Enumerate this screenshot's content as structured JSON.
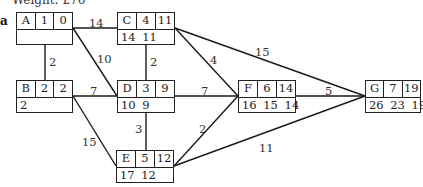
{
  "header": {
    "title": "Weight: £76",
    "part_label": "a"
  },
  "nodes": [
    {
      "id": "A",
      "duration": "1",
      "earliest": "0",
      "latest": "",
      "x": 16,
      "y": 12,
      "w": 57
    },
    {
      "id": "B",
      "duration": "2",
      "earliest": "2",
      "latest": "2",
      "x": 16,
      "y": 80,
      "w": 57
    },
    {
      "id": "C",
      "duration": "4",
      "earliest": "11",
      "latest": "14 11",
      "x": 117,
      "y": 12,
      "w": 58
    },
    {
      "id": "D",
      "duration": "3",
      "earliest": "9",
      "latest": "10 9",
      "x": 117,
      "y": 80,
      "w": 58
    },
    {
      "id": "E",
      "duration": "5",
      "earliest": "12",
      "latest": "17 12",
      "x": 116,
      "y": 150,
      "w": 58
    },
    {
      "id": "F",
      "duration": "6",
      "earliest": "14",
      "latest": "16 15 14",
      "x": 238,
      "y": 80,
      "w": 58
    },
    {
      "id": "G",
      "duration": "7",
      "earliest": "19",
      "latest": "26 23 19",
      "x": 365,
      "y": 80,
      "w": 56
    }
  ],
  "edges": [
    {
      "from": "A",
      "to": "C",
      "weight": "14",
      "x1": 73,
      "y1": 28,
      "x2": 117,
      "y2": 28,
      "lx": 89,
      "ly": 16
    },
    {
      "from": "A",
      "to": "B",
      "weight": "2",
      "x1": 45,
      "y1": 43,
      "x2": 45,
      "y2": 80,
      "lx": 49,
      "ly": 55
    },
    {
      "from": "A",
      "to": "D",
      "weight": "10",
      "x1": 73,
      "y1": 28,
      "x2": 117,
      "y2": 96,
      "lx": 97,
      "ly": 52
    },
    {
      "from": "C",
      "to": "D",
      "weight": "2",
      "x1": 146,
      "y1": 43,
      "x2": 146,
      "y2": 80,
      "lx": 150,
      "ly": 55
    },
    {
      "from": "C",
      "to": "F",
      "weight": "4",
      "x1": 175,
      "y1": 28,
      "x2": 238,
      "y2": 96,
      "lx": 210,
      "ly": 53
    },
    {
      "from": "C",
      "to": "G",
      "weight": "15",
      "x1": 175,
      "y1": 28,
      "x2": 365,
      "y2": 96,
      "lx": 255,
      "ly": 45
    },
    {
      "from": "B",
      "to": "D",
      "weight": "7",
      "x1": 73,
      "y1": 96,
      "x2": 117,
      "y2": 96,
      "lx": 90,
      "ly": 84
    },
    {
      "from": "B",
      "to": "E",
      "weight": "15",
      "x1": 73,
      "y1": 96,
      "x2": 116,
      "y2": 166,
      "lx": 82,
      "ly": 135
    },
    {
      "from": "D",
      "to": "F",
      "weight": "7",
      "x1": 175,
      "y1": 96,
      "x2": 238,
      "y2": 96,
      "lx": 201,
      "ly": 84
    },
    {
      "from": "D",
      "to": "E",
      "weight": "3",
      "x1": 146,
      "y1": 112,
      "x2": 146,
      "y2": 150,
      "lx": 135,
      "ly": 122
    },
    {
      "from": "E",
      "to": "F",
      "weight": "2",
      "x1": 174,
      "y1": 166,
      "x2": 238,
      "y2": 96,
      "lx": 199,
      "ly": 122
    },
    {
      "from": "F",
      "to": "G",
      "weight": "5",
      "x1": 296,
      "y1": 96,
      "x2": 365,
      "y2": 96,
      "lx": 325,
      "ly": 84
    },
    {
      "from": "E",
      "to": "G",
      "weight": "11",
      "x1": 174,
      "y1": 166,
      "x2": 365,
      "y2": 96,
      "lx": 259,
      "ly": 141
    }
  ]
}
